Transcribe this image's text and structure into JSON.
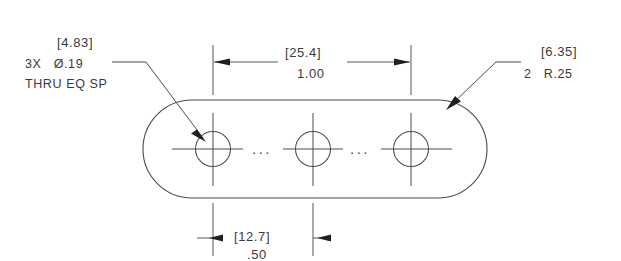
{
  "drawing": {
    "title": "Obround plate with 3 equally spaced through holes",
    "line_color": "#4b4b4b",
    "text_color": "#3a3a3a",
    "background": "#ffffff"
  },
  "notes": {
    "hole_note": {
      "metric_bracket": "[4.83]",
      "callout": "3X   Ø.19",
      "detail": "THRU EQ SP"
    },
    "radius_note": {
      "metric_bracket": "[6.35]",
      "callout": "2   R.25"
    }
  },
  "dimensions": {
    "top": {
      "metric_bracket": "[25.4]",
      "value": "1.00"
    },
    "bottom": {
      "metric_bracket": "[12.7]",
      "value": ".50"
    }
  },
  "symbols": {
    "ellipsis_left": "...",
    "ellipsis_right": "..."
  },
  "geometry": {
    "hole_count": 3,
    "hole_diameter_in": 0.19,
    "hole_diameter_mm": 4.83,
    "corner_radius_in": 0.25,
    "corner_radius_mm": 6.35,
    "hole_spacing_in": 0.5,
    "hole_spacing_mm": 12.7,
    "overall_hole_span_in": 1.0,
    "overall_hole_span_mm": 25.4
  }
}
